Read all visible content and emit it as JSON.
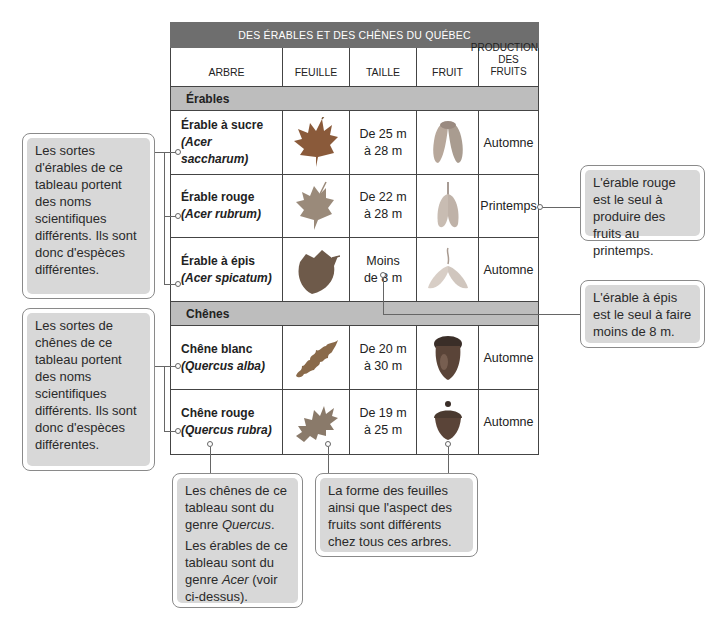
{
  "table": {
    "title": "DES ÉRABLES ET DES CHÊNES DU QUÉBEC",
    "headers": [
      "ARBRE",
      "FEUILLE",
      "TAILLE",
      "FRUIT",
      "PRODUCTION DES FRUITS"
    ],
    "groups": [
      {
        "label": "Érables",
        "rows": [
          {
            "name": "Érable à sucre",
            "scientific": "(Acer saccharum)",
            "leaf_icon": "maple-leaf-icon",
            "size": "De 25 m à 28 m",
            "fruit_icon": "samara-icon",
            "production": "Automne"
          },
          {
            "name": "Érable rouge",
            "scientific": "(Acer rubrum)",
            "leaf_icon": "maple-leaf-icon",
            "size": "De 22 m à 28 m",
            "fruit_icon": "samara-icon",
            "production": "Printemps"
          },
          {
            "name": "Érable à épis",
            "scientific": "(Acer spicatum)",
            "leaf_icon": "maple-leaf-icon",
            "size": "Moins de 8 m",
            "fruit_icon": "samara-icon",
            "production": "Automne"
          }
        ]
      },
      {
        "label": "Chênes",
        "rows": [
          {
            "name": "Chêne blanc",
            "scientific": "(Quercus alba)",
            "leaf_icon": "oak-leaf-icon",
            "size": "De 20 m à 30 m",
            "fruit_icon": "acorn-icon",
            "production": "Automne"
          },
          {
            "name": "Chêne rouge",
            "scientific": "(Quercus rubra)",
            "leaf_icon": "oak-leaf-icon",
            "size": "De 19 m à 25 m",
            "fruit_icon": "acorn-icon",
            "production": "Automne"
          }
        ]
      }
    ]
  },
  "sizes_split": {
    "r0": [
      "De 25 m",
      "à 28 m"
    ],
    "r1": [
      "De 22 m",
      "à 28 m"
    ],
    "r2": [
      "Moins",
      "de 8 m"
    ],
    "r3": [
      "De 20 m",
      "à 30 m"
    ],
    "r4": [
      "De 19 m",
      "à 25 m"
    ]
  },
  "headers_split": {
    "production": [
      "PRODUCTION",
      "DES FRUITS"
    ]
  },
  "callouts": {
    "maples_species": "Les sortes d'érables de ce tableau portent des noms scientifiques différents. Ils sont donc d'espèces différentes.",
    "oaks_species": "Les sortes de chênes de ce tableau portent des noms scientifiques différents. Ils sont donc d'espèces différentes.",
    "red_maple_spring": "L'érable rouge est le seul à produire des fruits au printemps.",
    "mountain_maple_size": "L'érable à épis est le seul à faire moins de 8 m.",
    "genus_p1_a": "Les chênes de ce tableau sont du genre ",
    "genus_p1_i": "Quercus",
    "genus_p1_b": ".",
    "genus_p2_a": "Les érables de ce tableau sont du genre ",
    "genus_p2_i": "Acer",
    "genus_p2_b": " (voir ci-dessus).",
    "leaves_fruits": "La forme des feuilles ainsi que l'aspect des fruits sont différents chez tous ces arbres."
  },
  "colors": {
    "title_bar": "#6e6e6e",
    "group_row": "#bdbdbd",
    "callout_fill": "#d8d8d8",
    "callout_border": "#8a8a8a"
  }
}
